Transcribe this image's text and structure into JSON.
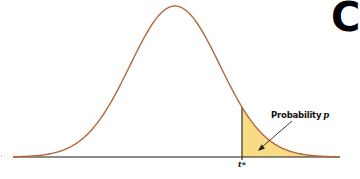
{
  "chart_data": {
    "type": "area",
    "title": "",
    "xlabel": "",
    "ylabel": "",
    "curve": {
      "center": 0,
      "shape": "t-distribution density",
      "x_range": [
        -3.5,
        3.5
      ]
    },
    "critical_value_label": "t*",
    "critical_value_position_sd": 1.5,
    "shaded_region": {
      "from": "t*",
      "to": "+infinity",
      "label": "Probability p"
    },
    "annotations": [
      {
        "text": "Probability p",
        "arrow_to": "shaded upper tail"
      },
      {
        "text": "t*",
        "position": "x-axis below vertical line"
      }
    ],
    "grid": false,
    "legend": "none"
  },
  "annotation": {
    "prob_word": "Probability",
    "prob_var": "p",
    "tstar": "t*"
  },
  "corner_glyph": "C",
  "colors": {
    "curve": "#b5653a",
    "fill": "#f8dc85",
    "axis": "#1a1a1a",
    "tline": "#222222",
    "arrow": "#222222"
  }
}
